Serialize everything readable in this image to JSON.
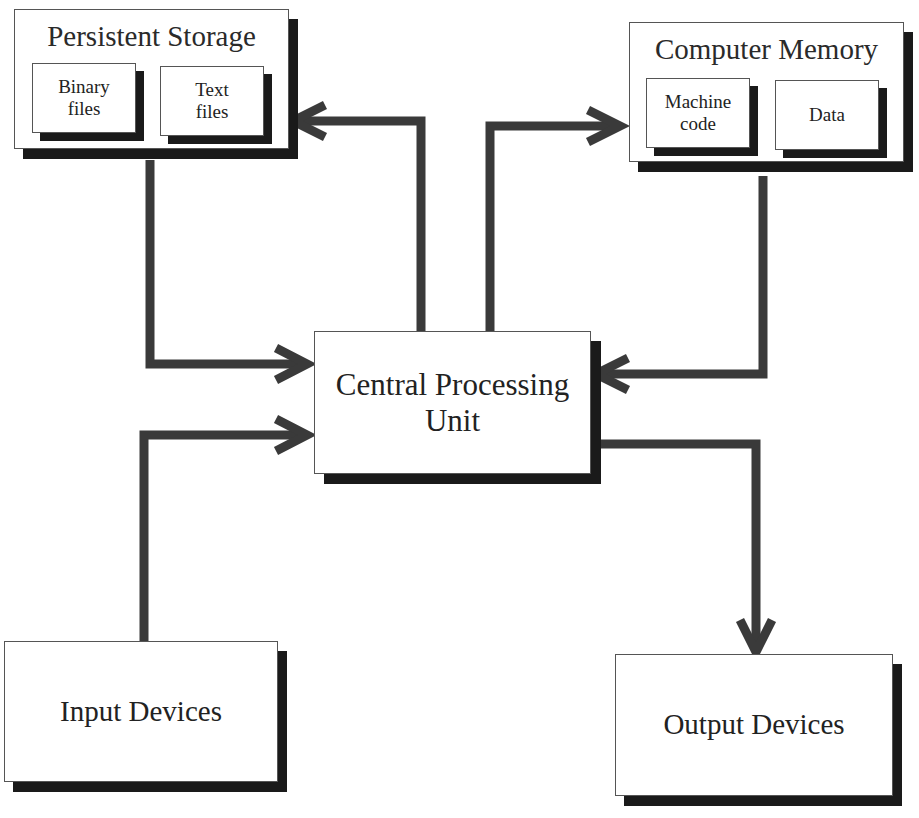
{
  "diagram": {
    "stroke_color": "#3a3a3a",
    "shadow_color": "#1a1a1a",
    "nodes": {
      "persistent_storage": {
        "label": "Persistent Storage",
        "children": [
          {
            "label_line1": "Binary",
            "label_line2": "files"
          },
          {
            "label_line1": "Text",
            "label_line2": "files"
          }
        ]
      },
      "computer_memory": {
        "label": "Computer Memory",
        "children": [
          {
            "label_line1": "Machine",
            "label_line2": "code"
          },
          {
            "label_line1": "Data",
            "label_line2": ""
          }
        ]
      },
      "cpu": {
        "label_line1": "Central Processing",
        "label_line2": "Unit"
      },
      "input_devices": {
        "label": "Input Devices"
      },
      "output_devices": {
        "label": "Output Devices"
      }
    },
    "edges": [
      {
        "from": "Persistent Storage",
        "to": "Central Processing Unit"
      },
      {
        "from": "Central Processing Unit",
        "to": "Persistent Storage"
      },
      {
        "from": "Central Processing Unit",
        "to": "Computer Memory"
      },
      {
        "from": "Computer Memory",
        "to": "Central Processing Unit"
      },
      {
        "from": "Input Devices",
        "to": "Central Processing Unit"
      },
      {
        "from": "Central Processing Unit",
        "to": "Output Devices"
      }
    ]
  }
}
